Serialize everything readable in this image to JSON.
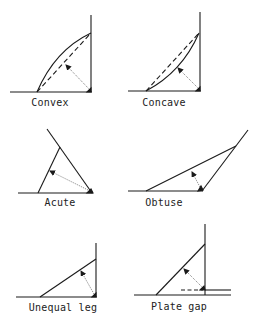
{
  "panels": [
    {
      "id": "convex",
      "label": "Convex",
      "label_x": 50,
      "label_y": 97
    },
    {
      "id": "concave",
      "label": "Concave",
      "label_x": 164,
      "label_y": 97
    },
    {
      "id": "acute",
      "label": "Acute",
      "label_x": 60,
      "label_y": 197
    },
    {
      "id": "obtuse",
      "label": "Obtuse",
      "label_x": 164,
      "label_y": 197
    },
    {
      "id": "unequal-leg",
      "label": "Unequal leg",
      "label_x": 63,
      "label_y": 302
    },
    {
      "id": "plate-gap",
      "label": "Plate gap",
      "label_x": 179,
      "label_y": 301
    }
  ],
  "colors": {
    "line": "#1a1a1a",
    "dotted": "#555555",
    "background": "#ffffff"
  }
}
